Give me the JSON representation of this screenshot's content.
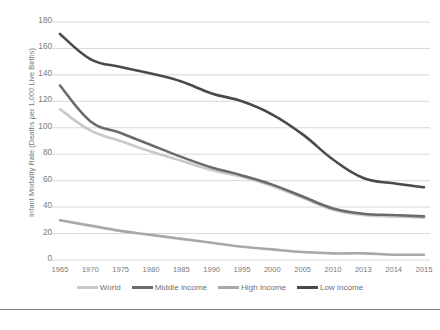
{
  "chart_data": {
    "type": "line",
    "title": "",
    "xlabel": "",
    "ylabel": "Infant Mortality Rate (Deaths per 1,000 Live Births)",
    "categories": [
      "1965",
      "1970",
      "1975",
      "1980",
      "1985",
      "1990",
      "1995",
      "2000",
      "2005",
      "2010",
      "2013",
      "2014",
      "2015"
    ],
    "ylim": [
      0,
      180
    ],
    "ytick_step": 20,
    "yticks": [
      0,
      20,
      40,
      60,
      80,
      100,
      120,
      140,
      160,
      180
    ],
    "grid": "horizontal",
    "legend_position": "bottom",
    "series": [
      {
        "name": "World",
        "color": "#c9c9c9",
        "values": [
          114,
          98,
          90,
          82,
          75,
          68,
          63,
          56,
          47,
          38,
          34,
          33,
          32
        ]
      },
      {
        "name": "Middle income",
        "color": "#6b6b6b",
        "values": [
          132,
          105,
          96,
          87,
          78,
          70,
          64,
          57,
          48,
          39,
          35,
          34,
          33
        ]
      },
      {
        "name": "High income",
        "color": "#a8a8a8",
        "values": [
          30,
          26,
          22,
          19,
          16,
          13,
          10,
          8,
          6,
          5,
          5,
          4,
          4
        ]
      },
      {
        "name": "Low income",
        "color": "#4a4a4a",
        "values": [
          171,
          152,
          146,
          141,
          135,
          126,
          120,
          110,
          95,
          76,
          62,
          58,
          55
        ]
      }
    ]
  },
  "legend": {
    "entries": [
      {
        "label": "World"
      },
      {
        "label": "Middle income"
      },
      {
        "label": "High income"
      },
      {
        "label": "Low income"
      }
    ]
  },
  "caption": {
    "text": ""
  },
  "colors": {
    "gridline": "#d4d4d4",
    "axis_text": "#7a7a7a",
    "footer_rule": "#8a8a8a"
  }
}
